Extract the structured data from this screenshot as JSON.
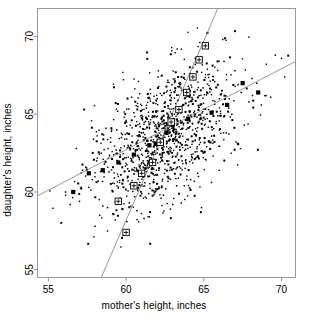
{
  "chart_data": {
    "type": "scatter",
    "title": "",
    "xlabel": "mother's height, inches",
    "ylabel": "daughter's height, inches",
    "xlim": [
      54.3,
      70.9
    ],
    "ylim": [
      54.5,
      71.8
    ],
    "xticks": [
      55,
      60,
      65,
      70
    ],
    "yticks": [
      55,
      60,
      65,
      70
    ],
    "xtick_labels": [
      "55",
      "60",
      "65",
      "70"
    ],
    "ytick_labels": [
      "55",
      "60",
      "65",
      "70"
    ],
    "grid": false,
    "legend": "none",
    "point_color": "#000000",
    "line_color": "#808080",
    "marker_color": "#000000",
    "box_color": "#999999",
    "series": [
      {
        "name": "daughter vs mother heights",
        "marker": "small-dot",
        "x": [
          56.4,
          57.2,
          57.6,
          58.1,
          58.3,
          58.6,
          58.8,
          59.0,
          59.1,
          59.2,
          59.3,
          59.4,
          59.5,
          59.6,
          59.7,
          59.8,
          59.9,
          60.0,
          60.0,
          60.1,
          60.2,
          60.3,
          60.4,
          60.5,
          60.6,
          60.7,
          60.8,
          60.9,
          61.0,
          61.0,
          61.1,
          61.2,
          61.3,
          61.4,
          61.5,
          61.6,
          61.7,
          61.8,
          61.9,
          62.0,
          62.0,
          62.1,
          62.2,
          62.3,
          62.4,
          62.5,
          62.6,
          62.7,
          62.8,
          62.9,
          63.0,
          63.0,
          63.1,
          63.2,
          63.3,
          63.4,
          63.5,
          63.6,
          63.7,
          63.8,
          63.9,
          64.0,
          64.1,
          64.2,
          64.3,
          64.4,
          64.5,
          64.6,
          64.7,
          64.8,
          64.9,
          65.0,
          65.2,
          65.4,
          65.6,
          65.8,
          66.0,
          66.3,
          66.6,
          67.0,
          67.4,
          67.9,
          68.4,
          69.0,
          69.6,
          70.2,
          55.8,
          56.1,
          56.8,
          57.0,
          57.4,
          57.9,
          58.0,
          58.2,
          58.4,
          58.5,
          58.7,
          58.9,
          59.05,
          59.15,
          59.25,
          59.35,
          59.45,
          59.55,
          59.65,
          59.75,
          59.85,
          59.95,
          60.05,
          60.15,
          60.25,
          60.35,
          60.45,
          60.55,
          60.65,
          60.75,
          60.85,
          60.95,
          61.05,
          61.15,
          61.25,
          61.35,
          61.45,
          61.55,
          61.65,
          61.75,
          61.85,
          61.95,
          62.05,
          62.15,
          62.25,
          62.35,
          62.45,
          62.55,
          62.65,
          62.75,
          62.85,
          62.95,
          63.05,
          63.15,
          63.25,
          63.35,
          63.45,
          63.55,
          63.65,
          63.75,
          63.85,
          63.95,
          64.05,
          64.15,
          64.25,
          64.35,
          64.45,
          64.55,
          64.65,
          64.75,
          64.85,
          64.95,
          65.1,
          65.3,
          65.5,
          65.7,
          65.9,
          66.15,
          66.45,
          66.8,
          67.2,
          67.6,
          68.1,
          68.7,
          69.3,
          70.0
        ],
        "y": [
          59.2,
          61.4,
          60.3,
          62.0,
          58.5,
          61.8,
          59.0,
          63.2,
          60.1,
          62.4,
          58.2,
          64.0,
          61.0,
          59.6,
          63.5,
          60.8,
          62.2,
          57.4,
          64.6,
          61.5,
          59.3,
          63.0,
          60.4,
          65.1,
          62.6,
          58.8,
          61.2,
          64.2,
          59.9,
          63.8,
          62.0,
          60.6,
          65.4,
          61.8,
          58.4,
          63.3,
          64.8,
          62.1,
          60.2,
          66.0,
          63.6,
          61.4,
          64.4,
          62.8,
          59.8,
          65.8,
          63.1,
          61.0,
          64.0,
          66.4,
          62.3,
          59.2,
          65.0,
          63.4,
          61.6,
          67.0,
          64.6,
          62.0,
          65.6,
          63.0,
          60.8,
          66.8,
          64.2,
          62.4,
          68.0,
          65.2,
          63.6,
          61.2,
          66.2,
          64.8,
          62.6,
          69.4,
          65.0,
          63.2,
          67.2,
          64.4,
          66.0,
          68.4,
          65.4,
          67.8,
          66.4,
          65.8,
          67.0,
          66.2,
          68.8,
          67.4,
          58.0,
          60.0,
          62.8,
          59.4,
          61.6,
          63.4,
          57.8,
          60.7,
          62.5,
          59.1,
          64.1,
          61.3,
          63.9,
          58.6,
          60.9,
          62.7,
          65.2,
          59.5,
          61.1,
          63.7,
          60.3,
          64.5,
          58.1,
          62.9,
          60.5,
          66.1,
          61.9,
          59.7,
          63.1,
          65.5,
          62.2,
          60.0,
          64.7,
          58.3,
          61.7,
          63.3,
          59.9,
          66.6,
          62.4,
          60.6,
          64.9,
          61.4,
          67.4,
          63.8,
          59.6,
          62.0,
          65.7,
          60.2,
          64.3,
          62.6,
          58.9,
          66.9,
          61.5,
          63.5,
          60.4,
          65.9,
          62.9,
          59.3,
          64.1,
          67.6,
          61.9,
          63.0,
          66.3,
          60.8,
          62.2,
          65.1,
          68.2,
          63.9,
          61.0,
          64.7,
          59.0,
          66.7,
          62.1,
          65.3,
          63.6,
          67.1,
          64.9,
          66.5,
          63.8,
          65.0,
          66.9,
          64.3,
          67.3,
          65.6,
          66.1,
          68.6
        ]
      }
    ],
    "regression_line": {
      "name": "regression of daughter on mother",
      "slope": 0.52,
      "x1": 54.3,
      "y1": 59.75,
      "x2": 70.9,
      "y2": 68.4,
      "markers_x": [
        56.6,
        57.6,
        58.5,
        59.5,
        60.5,
        61.5,
        61.9,
        62.1,
        62.6,
        63.0,
        64.0,
        65.5,
        66.5,
        67.5,
        68.5
      ],
      "markers_y": [
        60.0,
        61.2,
        61.4,
        61.9,
        62.4,
        63.0,
        63.1,
        63.2,
        63.8,
        64.3,
        64.7,
        65.1,
        65.6,
        67.0,
        66.4
      ],
      "marker_style": "filled-square"
    },
    "sd_line": {
      "name": "SD line",
      "slope": 2.3,
      "x1": 58.4,
      "y1": 54.5,
      "x2": 65.9,
      "y2": 71.8,
      "markers_x": [
        60.0,
        59.5,
        60.5,
        61.0,
        61.7,
        62.2,
        62.9,
        63.4,
        63.9,
        64.3,
        64.7,
        65.1
      ],
      "markers_y": [
        57.4,
        59.4,
        60.4,
        61.2,
        61.9,
        63.2,
        64.5,
        65.3,
        66.4,
        67.4,
        68.5,
        69.4
      ],
      "marker_style": "crossed-square"
    }
  }
}
